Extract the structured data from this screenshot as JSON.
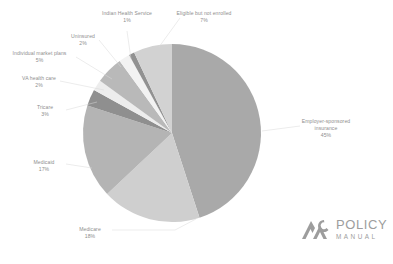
{
  "chart_data": {
    "type": "pie",
    "title": "",
    "subtitle": "",
    "xlabel": "",
    "ylabel": "",
    "legend_position": "none",
    "grid": false,
    "units": "percent",
    "total": 100,
    "categories": [
      "Employer-sponsored insurance",
      "Medicare",
      "Medicaid",
      "Tricare",
      "VA health care",
      "Individual market plans",
      "Uninsured",
      "Indian Health Service",
      "Eligible but not enrolled"
    ],
    "values": [
      45,
      18,
      17,
      3,
      2,
      5,
      2,
      1,
      7
    ],
    "slices": [
      {
        "label": "Employer-sponsored insurance",
        "value": 45,
        "pct": "45%",
        "color": "#a9a9a9"
      },
      {
        "label": "Medicare",
        "value": 18,
        "pct": "18%",
        "color": "#cfcfcf"
      },
      {
        "label": "Medicaid",
        "value": 17,
        "pct": "17%",
        "color": "#b4b4b4"
      },
      {
        "label": "Tricare",
        "value": 3,
        "pct": "3%",
        "color": "#8f8f8f"
      },
      {
        "label": "VA health care",
        "value": 2,
        "pct": "2%",
        "color": "#ededed"
      },
      {
        "label": "Individual market plans",
        "value": 5,
        "pct": "5%",
        "color": "#b9b9b9"
      },
      {
        "label": "Uninsured",
        "value": 2,
        "pct": "2%",
        "color": "#f2f2f2"
      },
      {
        "label": "Indian Health Service",
        "value": 1,
        "pct": "1%",
        "color": "#919191"
      },
      {
        "label": "Eligible but not enrolled",
        "value": 7,
        "pct": "7%",
        "color": "#d2d2d2"
      }
    ],
    "labels": {
      "employer": {
        "name": "Employer-sponsored",
        "name2": "insurance",
        "pct": "45%"
      },
      "medicare": {
        "name": "Medicare",
        "pct": "18%"
      },
      "medicaid": {
        "name": "Medicaid",
        "pct": "17%"
      },
      "tricare": {
        "name": "Tricare",
        "pct": "3%"
      },
      "va": {
        "name": "VA health care",
        "pct": "2%"
      },
      "individual": {
        "name": "Individual market plans",
        "pct": "5%"
      },
      "uninsured": {
        "name": "Uninsured",
        "pct": "2%"
      },
      "ihs": {
        "name": "Indian Health Service",
        "pct": "1%"
      },
      "eligible": {
        "name": "Eligible but not enrolled",
        "pct": "7%"
      }
    }
  },
  "logo": {
    "primary": "POLICY",
    "secondary": "MANUAL"
  },
  "colors": {
    "background": "#ffffff",
    "text": "#8e8e8e",
    "leader_line": "#d8d8d8",
    "logo": "#9d9d9d"
  }
}
